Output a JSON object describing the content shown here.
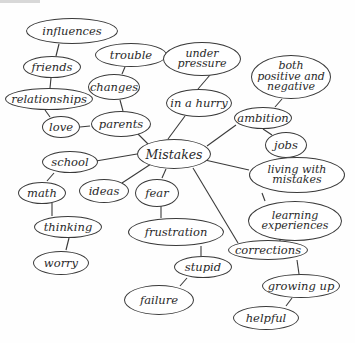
{
  "diagram": {
    "type": "mind-map",
    "center": "Mistakes",
    "nodes": {
      "influences": "influences",
      "trouble": "trouble",
      "under_pressure": "under\npressure",
      "both_positive_negative": "both\npositive and\nnegative",
      "friends": "friends",
      "changes": "changes",
      "relationships": "relationships",
      "in_a_hurry": "in a hurry",
      "ambition": "ambition",
      "love": "love",
      "parents": "parents",
      "mistakes": "Mistakes",
      "jobs": "jobs",
      "school": "school",
      "living_with_mistakes": "living with\nmistakes",
      "math": "math",
      "ideas": "ideas",
      "fear": "fear",
      "learning_experiences": "learning\nexperiences",
      "thinking": "thinking",
      "frustration": "frustration",
      "corrections": "corrections",
      "stupid": "stupid",
      "worry": "worry",
      "growing_up": "growing up",
      "failure": "failure",
      "helpful": "helpful"
    },
    "edges": [
      [
        "mistakes",
        "parents"
      ],
      [
        "mistakes",
        "in a hurry"
      ],
      [
        "mistakes",
        "ambition"
      ],
      [
        "mistakes",
        "living with mistakes"
      ],
      [
        "mistakes",
        "corrections"
      ],
      [
        "mistakes",
        "fear"
      ],
      [
        "mistakes",
        "ideas"
      ],
      [
        "mistakes",
        "school"
      ],
      [
        "parents",
        "changes"
      ],
      [
        "parents",
        "love"
      ],
      [
        "changes",
        "trouble"
      ],
      [
        "love",
        "relationships"
      ],
      [
        "relationships",
        "friends"
      ],
      [
        "friends",
        "influences"
      ],
      [
        "in a hurry",
        "under pressure"
      ],
      [
        "ambition",
        "both positive and negative"
      ],
      [
        "ambition",
        "jobs"
      ],
      [
        "living with mistakes",
        "learning experiences"
      ],
      [
        "learning experiences",
        "corrections"
      ],
      [
        "corrections",
        "growing up"
      ],
      [
        "growing up",
        "helpful"
      ],
      [
        "fear",
        "frustration"
      ],
      [
        "frustration",
        "stupid"
      ],
      [
        "stupid",
        "failure"
      ],
      [
        "school",
        "math"
      ],
      [
        "math",
        "thinking"
      ],
      [
        "thinking",
        "worry"
      ]
    ]
  }
}
